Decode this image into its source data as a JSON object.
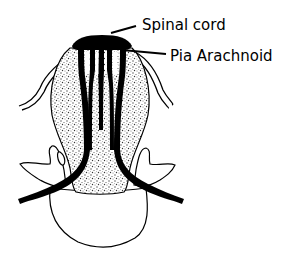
{
  "diagram": {
    "labels": [
      {
        "id": "spinal-cord",
        "text": "Spinal cord"
      },
      {
        "id": "pia-arachnoid",
        "text": "Pia Arachnoid"
      }
    ],
    "colors": {
      "ink": "#000000",
      "background": "#ffffff",
      "stipple": "#555555"
    }
  }
}
